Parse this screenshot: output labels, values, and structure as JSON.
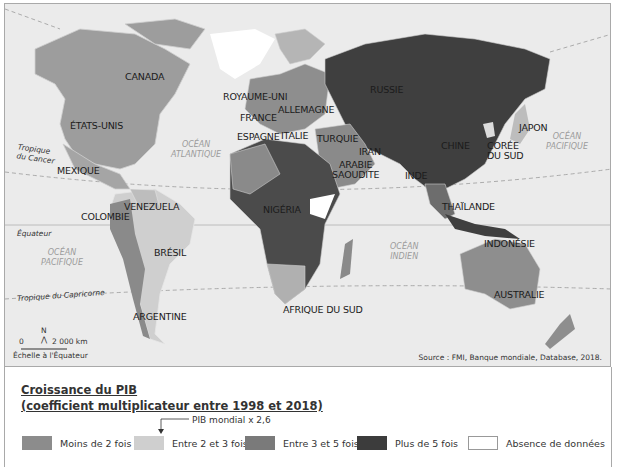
{
  "map": {
    "countries": [
      {
        "name": "CANADA"
      },
      {
        "name": "ÉTATS-UNIS"
      },
      {
        "name": "MEXIQUE"
      },
      {
        "name": "COLOMBIE"
      },
      {
        "name": "VENEZUELA"
      },
      {
        "name": "BRÉSIL"
      },
      {
        "name": "ARGENTINE"
      },
      {
        "name": "ROYAUME-UNI"
      },
      {
        "name": "FRANCE"
      },
      {
        "name": "ALLEMAGNE"
      },
      {
        "name": "ESPAGNE"
      },
      {
        "name": "ITALIE"
      },
      {
        "name": "TURQUIE"
      },
      {
        "name": "RUSSIE"
      },
      {
        "name": "IRAN"
      },
      {
        "name": "ARABIE\nSAOUDITE"
      },
      {
        "name": "NIGÉRIA"
      },
      {
        "name": "AFRIQUE DU SUD"
      },
      {
        "name": "INDE"
      },
      {
        "name": "CHINE"
      },
      {
        "name": "CORÉE\nDU SUD"
      },
      {
        "name": "JAPON"
      },
      {
        "name": "THAÏLANDE"
      },
      {
        "name": "INDONÉSIE"
      },
      {
        "name": "AUSTRALIE"
      }
    ],
    "oceans": [
      {
        "name": "OCÉAN\nATLANTIQUE"
      },
      {
        "name": "OCÉAN\nPACIFIQUE"
      },
      {
        "name": "OCÉAN\nPACIFIQUE"
      },
      {
        "name": "OCÉAN\nINDIEN"
      }
    ],
    "lines": {
      "cancer": "Tropique\ndu Cancer",
      "equator": "Équateur",
      "capricorn": "Tropique du Capricorne"
    },
    "north": "N",
    "scale_zero": "0",
    "scale_value": "2 000 km",
    "scale_caption": "Échelle à l'Équateur",
    "source": "Source : FMI, Banque mondiale, Database, 2018."
  },
  "legend": {
    "title_line1": "Croissance du PIB ",
    "title_line2": "(coefficient multiplicateur entre 1998 et 2018)",
    "world_note": "PIB mondial x 2,6",
    "items": [
      {
        "label": "Moins de 2 fois",
        "color": "#8c8c8c"
      },
      {
        "label": "Entre 2 et 3 fois",
        "color": "#cfcfcf"
      },
      {
        "label": "Entre 3 et 5 fois",
        "color": "#7a7a7a"
      },
      {
        "label": "Plus de 5 fois",
        "color": "#3c3c3c"
      },
      {
        "label": "Absence de données",
        "color": "#ffffff"
      }
    ]
  }
}
